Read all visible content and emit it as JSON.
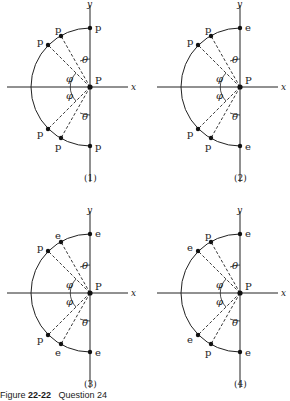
{
  "figure": {
    "caption_prefix": "Figure",
    "caption_number": "22-22",
    "caption_suffix": "Question 24",
    "axis_labels": {
      "x": "x",
      "y": "y"
    },
    "origin_label": "P",
    "angle_labels": {
      "theta": "θ",
      "phi": "φ"
    },
    "panels": [
      {
        "id": "1",
        "label": "(1)",
        "charges": {
          "top_axis": "p",
          "top_inner": "p",
          "top_outer": "p",
          "bottom_outer": "p",
          "bottom_inner": "p",
          "bottom_axis": "p"
        }
      },
      {
        "id": "2",
        "label": "(2)",
        "charges": {
          "top_axis": "e",
          "top_inner": "p",
          "top_outer": "p",
          "bottom_outer": "p",
          "bottom_inner": "p",
          "bottom_axis": "e"
        }
      },
      {
        "id": "3",
        "label": "(3)",
        "charges": {
          "top_axis": "e",
          "top_inner": "e",
          "top_outer": "p",
          "bottom_outer": "p",
          "bottom_inner": "e",
          "bottom_axis": "e"
        }
      },
      {
        "id": "4",
        "label": "(4)",
        "charges": {
          "top_axis": "e",
          "top_inner": "p",
          "top_outer": "e",
          "bottom_outer": "e",
          "bottom_inner": "p",
          "bottom_axis": "e"
        }
      }
    ]
  }
}
